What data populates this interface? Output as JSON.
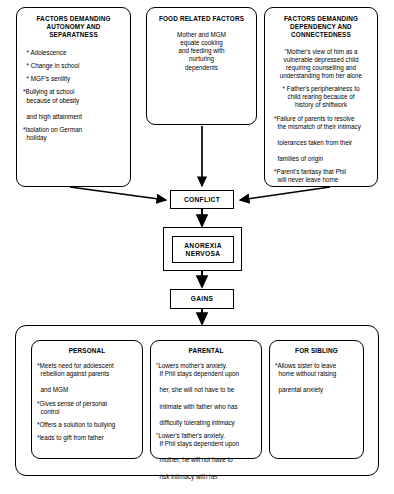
{
  "diagram": {
    "line_color": "#000000",
    "background": "#ffffff"
  },
  "top_boxes": [
    {
      "id": "autonomy",
      "heading": "FACTORS DEMANDING AUTONOMY AND SEPARATNESS",
      "align": "left",
      "items": [
        "* Adolescence",
        "* Change in school",
        "* MGF's senility",
        "*Bullying at school because of obesity and high attainment",
        "*Isolation on German holiday"
      ],
      "items_wrapped": [
        [
          "* Adolescence"
        ],
        [
          "* Change in school"
        ],
        [
          "* MGF's senility"
        ],
        [
          "*Bullying at school",
          "because of obesity",
          "and high attainment"
        ],
        [
          "*Isolation on German",
          "holiday"
        ]
      ]
    },
    {
      "id": "food",
      "heading": "FOOD RELATED FACTORS",
      "align": "center",
      "items": [
        "Mother and MGM equate cooking and feeding with nurturing dependents"
      ],
      "items_wrapped": [
        [
          "Mother and MGM",
          "equate cooking",
          "and feeding with",
          "nurturing",
          "dependents"
        ]
      ]
    },
    {
      "id": "dependency",
      "heading": "FACTORS DEMANDING DEPENDENCY AND CONNECTEDNESS",
      "align": "center",
      "items": [
        "*Mother's view of him as a vulnerable depressed child requiring counselling and understanding from her alone",
        "* Father's peripheralness to child rearing because of history of shiftwork",
        "*Failure of parents to resolve the mismatch of their intimacy tolerances taken from their families of origin",
        "*Parent's fantasy that Phil will never leave home"
      ],
      "items_wrapped": [
        [
          "\"Mother's view of him as a",
          "vulnerable depressed child",
          "requiring counselling and",
          "understanding from her alone"
        ],
        [
          "* Father's peripheralness to",
          "child rearing because of",
          "history of shiftwork"
        ],
        [
          "*Failure of parents to resolve",
          "the mismatch of their intimacy",
          "tolerances taken from their",
          "families of origin"
        ],
        [
          "*Parent's fantasy that Phil",
          "will never leave home"
        ]
      ]
    }
  ],
  "chain": [
    {
      "id": "conflict",
      "label": "CONFLICT"
    },
    {
      "id": "anorexia",
      "label": "ANOREXIA NERVOSA",
      "double_border": true
    },
    {
      "id": "gains",
      "label": "GAINS"
    }
  ],
  "gains_boxes": [
    {
      "id": "personal",
      "heading": "PERSONAL",
      "items_wrapped": [
        [
          "*Meets need for adolescent",
          "rebellion against parents",
          "and MGM"
        ],
        [
          "*Gives sense of personal",
          "control"
        ],
        [
          "*Offers a solution to bullying"
        ],
        [
          "*leads to gift from father"
        ]
      ]
    },
    {
      "id": "parental",
      "heading": "PARENTAL",
      "items_wrapped": [
        [
          "\"Lowers mother's anxiety.",
          "If Phil stays dependent upon",
          "her, she will not have to be",
          "intimate with father who has",
          "difficulty tolerating intimacy"
        ],
        [
          "\"Lower's father's anxiety.",
          "If Phil stays dependent upon",
          "mother, he will not have to",
          "risk intimacy with her"
        ]
      ]
    },
    {
      "id": "sibling",
      "heading": "FOR SIBLING",
      "items_wrapped": [
        [
          "*Allows sister to leave",
          "home  without raising",
          "parental anxiety"
        ]
      ]
    }
  ]
}
